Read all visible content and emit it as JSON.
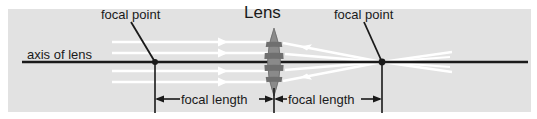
{
  "figure": {
    "kind": "optics-ray-diagram",
    "title": "Lens",
    "background_color": "#e2e2e2",
    "page_color": "#ffffff",
    "ink_color": "#1a1a1a",
    "ray_color": "#ffffff",
    "lens_fill": "#8a8a8a",
    "lens_band_fill": "#6f6f6f"
  },
  "labels": {
    "focal_point_left": "focal point",
    "focal_point_right": "focal point",
    "lens": "Lens",
    "axis_of_lens": "axis of lens",
    "focal_length_left": "focal length",
    "focal_length_right": "focal length"
  },
  "geometry": {
    "axis_y": 62,
    "axis_x_start": 22,
    "axis_x_end": 528,
    "lens_center_x": 274,
    "lens_top_y": 28,
    "lens_bottom_y": 96,
    "lens_half_width": 11,
    "focal_point_left_x": 155,
    "focal_point_right_x": 382,
    "dimension_y": 99,
    "ray_offsets": [
      -20,
      -9,
      9,
      20
    ],
    "ray_start_x": 112,
    "ray_count": 4
  }
}
